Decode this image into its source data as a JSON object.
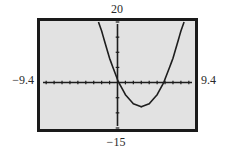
{
  "window": {
    "xmin_label": "−9.4",
    "xmax_label": "9.4",
    "ymin_label": "−15",
    "ymax_label": "20"
  },
  "colors": {
    "frame": "#1a1a1a",
    "screen_bg": "#e2e2e2",
    "axis": "#1e1e1e",
    "curve": "#1e1e1e"
  },
  "chart_data": {
    "type": "line",
    "title": "",
    "xlabel": "",
    "ylabel": "",
    "xlim": [
      -9.4,
      9.4
    ],
    "ylim": [
      -15,
      20
    ],
    "grid": false,
    "legend": null,
    "axis_tick_spacing": {
      "x": 1,
      "y": 5
    },
    "series": [
      {
        "name": "f(x) ≈ x² − 6x + 1",
        "x": [
          -2.4,
          -2,
          -1,
          0,
          0.17,
          1,
          2,
          3,
          4,
          5,
          5.83,
          7,
          8,
          8.4
        ],
        "y": [
          20,
          17,
          8,
          1,
          0,
          -4,
          -7,
          -8,
          -7,
          -4,
          0,
          8,
          17,
          20
        ]
      }
    ],
    "annotations": [
      {
        "text": "20",
        "position": "top-center",
        "meaning": "Ymax"
      },
      {
        "text": "−15",
        "position": "bottom-center",
        "meaning": "Ymin"
      },
      {
        "text": "−9.4",
        "position": "left-middle",
        "meaning": "Xmin"
      },
      {
        "text": "9.4",
        "position": "right-middle",
        "meaning": "Xmax"
      }
    ]
  }
}
